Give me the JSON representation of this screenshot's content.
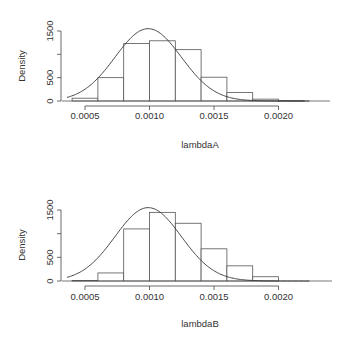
{
  "chart_data": [
    {
      "type": "bar",
      "subtype": "histogram_with_density_curve",
      "title": "",
      "xlabel": "lambdaA",
      "ylabel": "Density",
      "xlim": [
        0.0003,
        0.0024
      ],
      "ylim": [
        0,
        1600
      ],
      "xticks": [
        "0.0005",
        "0.0010",
        "0.0015",
        "0.0020"
      ],
      "xtick_values": [
        0.0005,
        0.001,
        0.0015,
        0.002
      ],
      "yticks": [
        "0",
        "500",
        "1000",
        "1500"
      ],
      "ytick_values": [
        0,
        500,
        1000,
        1500
      ],
      "ytick_labels_shown": [
        "0",
        "500",
        "1500"
      ],
      "bin_edges": [
        0.0004,
        0.0006,
        0.0008,
        0.001,
        0.0012,
        0.0014,
        0.0016,
        0.0018,
        0.002,
        0.0022
      ],
      "values": [
        60,
        500,
        1230,
        1290,
        1100,
        510,
        180,
        40,
        8
      ],
      "curve": {
        "type": "normal",
        "mean": 0.00099,
        "sd": 0.000257,
        "peak_density": 1550
      },
      "grid": false,
      "legend": null
    },
    {
      "type": "bar",
      "subtype": "histogram_with_density_curve",
      "title": "",
      "xlabel": "lambdaB",
      "ylabel": "Density",
      "xlim": [
        0.0003,
        0.0024
      ],
      "ylim": [
        0,
        1600
      ],
      "xticks": [
        "0.0005",
        "0.0010",
        "0.0015",
        "0.0020"
      ],
      "xtick_values": [
        0.0005,
        0.001,
        0.0015,
        0.002
      ],
      "yticks": [
        "0",
        "500",
        "1000",
        "1500"
      ],
      "ytick_values": [
        0,
        500,
        1000,
        1500
      ],
      "ytick_labels_shown": [
        "0",
        "500",
        "1500"
      ],
      "bin_edges": [
        0.0004,
        0.0006,
        0.0008,
        0.001,
        0.0012,
        0.0014,
        0.0016,
        0.0018,
        0.002
      ],
      "values": [
        10,
        170,
        1100,
        1450,
        1220,
        680,
        320,
        90
      ],
      "curve": {
        "type": "normal",
        "mean": 0.00099,
        "sd": 0.000257,
        "peak_density": 1550
      },
      "grid": false,
      "legend": null
    }
  ],
  "panels": [
    {
      "ylabel": "Density",
      "xlabel": "lambdaA"
    },
    {
      "ylabel": "Density",
      "xlabel": "lambdaB"
    }
  ]
}
